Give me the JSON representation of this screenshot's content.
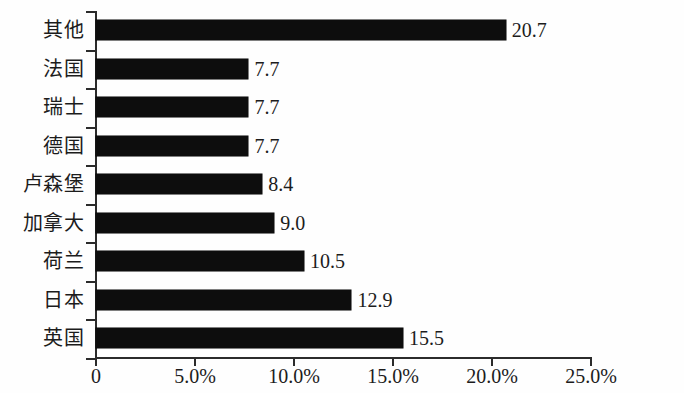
{
  "chart_data": {
    "type": "bar",
    "orientation": "horizontal",
    "title": "",
    "xlabel": "",
    "ylabel": "",
    "categories": [
      "其他",
      "法国",
      "瑞士",
      "德国",
      "卢森堡",
      "加拿大",
      "荷兰",
      "日本",
      "英国"
    ],
    "values": [
      20.7,
      7.7,
      7.7,
      7.7,
      8.4,
      9.0,
      10.5,
      12.9,
      15.5
    ],
    "value_labels": [
      "20.7",
      "7.7",
      "7.7",
      "7.7",
      "8.4",
      "9.0",
      "10.5",
      "12.9",
      "15.5"
    ],
    "unit": "%",
    "xlim": [
      0,
      25
    ],
    "xticks": [
      0,
      5,
      10,
      15,
      20,
      25
    ],
    "xtick_labels": [
      "0",
      "5.0%",
      "10.0%",
      "15.0%",
      "20.0%",
      "25.0%"
    ],
    "grid": false,
    "legend": null,
    "bar_color": "#0d0d0d",
    "axis_color": "#2b2b2b",
    "background": "#fefefe"
  }
}
